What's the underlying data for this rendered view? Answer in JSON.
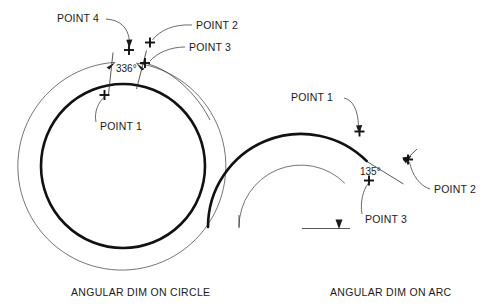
{
  "figure": {
    "title_left": "ANGULAR DIM ON CIRCLE",
    "title_right": "ANGULAR DIM ON ARC"
  },
  "circle_diagram": {
    "caption": "ANGULAR DIM ON CIRCLE",
    "dimension_value": "336°",
    "labels": {
      "point1": "POINT 1",
      "point2": "POINT 2",
      "point3": "POINT 3",
      "point4": "POINT 4"
    }
  },
  "arc_diagram": {
    "caption": "ANGULAR DIM ON ARC",
    "dimension_value": "135°",
    "labels": {
      "point1": "POINT 1",
      "point2": "POINT 2",
      "point3": "POINT 3"
    }
  },
  "colors": {
    "background": "#ffffff",
    "geometry_stroke": "#111111",
    "annotation_stroke": "#3a3a3a",
    "text": "#1a1a1a"
  }
}
